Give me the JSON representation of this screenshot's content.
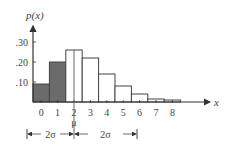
{
  "chart_data": {
    "type": "bar",
    "title": "",
    "ylabel": "p(x)",
    "xlabel": "x",
    "categories": [
      "0",
      "1",
      "2",
      "3",
      "4",
      "5",
      "6",
      "7",
      "8"
    ],
    "values": [
      0.09,
      0.2,
      0.26,
      0.22,
      0.14,
      0.08,
      0.04,
      0.015,
      0.01
    ],
    "shaded": [
      true,
      true,
      false,
      false,
      false,
      false,
      false,
      false,
      false
    ],
    "ylim": [
      0,
      0.35
    ],
    "yticks": [
      ".10",
      ".20",
      ".30"
    ],
    "ytick_values": [
      0.1,
      0.2,
      0.3
    ],
    "grid": false,
    "annotations": {
      "mean_label": "μ",
      "mean_position": 2.5,
      "left_interval_label": "2σ",
      "right_interval_label": "2σ"
    },
    "colors": {
      "shaded": "#6b6b6b",
      "unshaded": "#ffffff",
      "stroke": "#444444"
    }
  }
}
